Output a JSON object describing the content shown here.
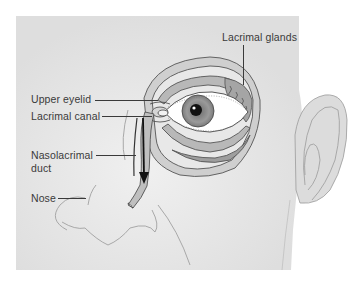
{
  "diagram": {
    "colors": {
      "background": "#ffffff",
      "skin": "#e2e2e2",
      "skin_light": "#ececec",
      "outline": "#8a8a8a",
      "line_dark": "#3a3a3a",
      "iris": "#8c8c8c",
      "pupil": "#111111",
      "gland": "#a8a8a8"
    },
    "labels": [
      {
        "id": "lacrimal-glands",
        "text": "Lacrimal glands"
      },
      {
        "id": "upper-eyelid",
        "text": "Upper eyelid"
      },
      {
        "id": "lacrimal-canal",
        "text": "Lacrimal canal"
      },
      {
        "id": "nasolacrimal-duct-line1",
        "text": "Nasolacrimal"
      },
      {
        "id": "nasolacrimal-duct-line2",
        "text": "duct"
      },
      {
        "id": "nose",
        "text": "Nose"
      }
    ]
  }
}
